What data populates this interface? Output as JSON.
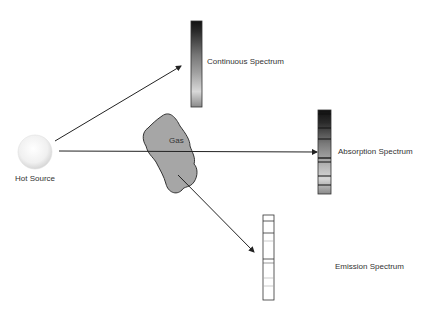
{
  "diagram": {
    "source": {
      "label": "Hot Source"
    },
    "gas": {
      "label": "Gas",
      "fill": "#a6a6a6",
      "stroke": "#333333"
    },
    "spectra": [
      {
        "id": "continuous",
        "label": "Continuous Spectrum"
      },
      {
        "id": "absorption",
        "label": "Absorption Spectrum"
      },
      {
        "id": "emission",
        "label": "Emission Spectrum"
      }
    ],
    "arrows": [
      {
        "from": "Hot Source",
        "to": "Continuous Spectrum"
      },
      {
        "from": "Hot Source",
        "to": "Absorption Spectrum",
        "through": "Gas"
      },
      {
        "from": "Gas",
        "to": "Emission Spectrum"
      }
    ]
  }
}
